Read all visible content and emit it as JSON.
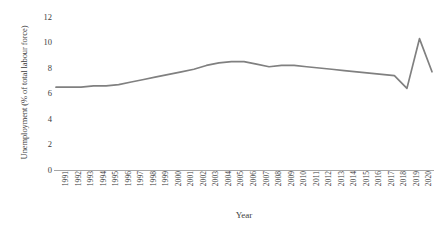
{
  "chart_data": {
    "type": "line",
    "title": "",
    "subtitle": "",
    "xlabel": "Year",
    "ylabel": "Unemployment (% of total labour force)",
    "x": [
      1991,
      1992,
      1993,
      1994,
      1995,
      1996,
      1997,
      1998,
      1999,
      2000,
      2001,
      2002,
      2003,
      2004,
      2005,
      2006,
      2007,
      2008,
      2009,
      2010,
      2011,
      2012,
      2013,
      2014,
      2015,
      2016,
      2017,
      2018,
      2019,
      2020,
      2021
    ],
    "categories": [
      "1991",
      "1992",
      "1993",
      "1994",
      "1995",
      "1996",
      "1997",
      "1998",
      "1999",
      "2000",
      "2001",
      "2002",
      "2003",
      "2004",
      "2005",
      "2006",
      "2007",
      "2008",
      "2009",
      "2010",
      "2011",
      "2012",
      "2013",
      "2014",
      "2015",
      "2016",
      "2017",
      "2018",
      "2019",
      "2020",
      "2021"
    ],
    "series": [
      {
        "name": "Unemployment",
        "color": "#808080",
        "values": [
          6.5,
          6.5,
          6.5,
          6.6,
          6.6,
          6.7,
          6.9,
          7.1,
          7.3,
          7.5,
          7.7,
          7.9,
          8.2,
          8.4,
          8.5,
          8.5,
          8.3,
          8.1,
          8.2,
          8.2,
          8.1,
          8.0,
          7.9,
          7.8,
          7.7,
          7.6,
          7.5,
          7.4,
          6.4,
          10.3,
          7.7
        ]
      }
    ],
    "xlim": [
      1991,
      2021
    ],
    "ylim": [
      0,
      12
    ],
    "yticks": [
      0,
      2,
      4,
      6,
      8,
      10,
      12
    ],
    "ytick_labels": [
      "0",
      "2",
      "4",
      "6",
      "8",
      "10",
      "12"
    ],
    "grid": false,
    "legend": false,
    "legend_position": "none",
    "axis_color": "#a6a6a6",
    "text_color": "#3c3c3c",
    "background": "#ffffff"
  }
}
